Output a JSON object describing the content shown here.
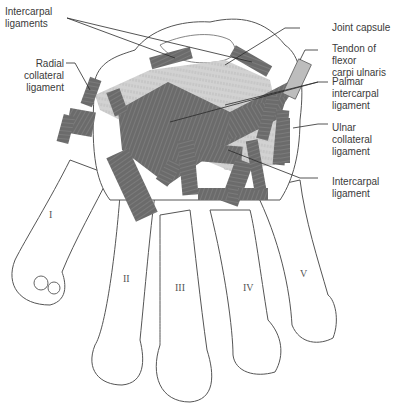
{
  "diagram": {
    "colors": {
      "ligament": "#6b6b6b",
      "ligament_stripe": "#858585",
      "capsule": "#c9c9c9",
      "bone_outline": "#555555",
      "label_text": "#3a3a3a",
      "leader_line": "#2a2a2a"
    },
    "labels": {
      "intercarpal_ligaments": [
        "Intercarpal",
        "ligaments"
      ],
      "radial_collateral": [
        "Radial",
        "collateral",
        "ligament"
      ],
      "joint_capsule": [
        "Joint capsule"
      ],
      "tendon_fcu": [
        "Tendon of flexor",
        "carpi ulnaris"
      ],
      "palmar_intercarpal": [
        "Palmar",
        "intercarpal",
        "ligament"
      ],
      "ulnar_collateral": [
        "Ulnar",
        "collateral",
        "ligament"
      ],
      "intercarpal_ligament": [
        "Intercarpal",
        "ligament"
      ]
    },
    "digits": [
      "I",
      "II",
      "III",
      "IV",
      "V"
    ]
  }
}
